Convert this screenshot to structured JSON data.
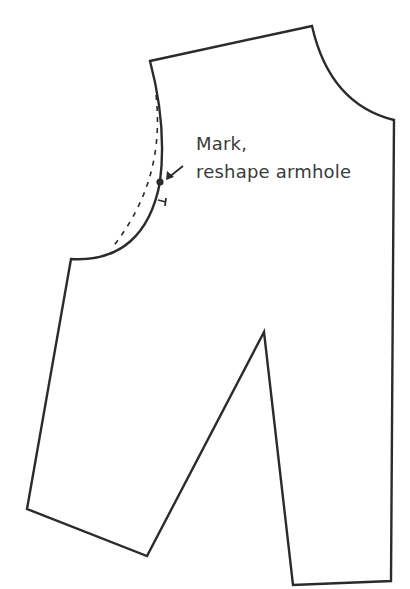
{
  "diagram": {
    "type": "sewing-pattern-piece",
    "colors": {
      "line": "#2b2b2b",
      "text": "#3a3a3a",
      "background": "#ffffff"
    },
    "annotation": {
      "line1": "Mark,",
      "line2": "reshape armhole"
    },
    "marks": {
      "dot": {
        "x": 160,
        "y": 182
      },
      "arrow_from": {
        "x": 183,
        "y": 165
      },
      "arrow_to": {
        "x": 166,
        "y": 179
      }
    }
  }
}
